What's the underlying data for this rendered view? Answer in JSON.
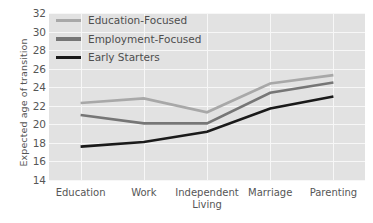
{
  "chart_data": {
    "type": "line",
    "title": "",
    "xlabel": "",
    "ylabel": "Expected age of transition",
    "categories": [
      "Education",
      "Work",
      "Independent\nLiving",
      "Marriage",
      "Parenting"
    ],
    "x_tick_labels": [
      "Education",
      "Work",
      "Independent Living",
      "Marriage",
      "Parenting"
    ],
    "ylim": [
      14,
      32
    ],
    "y_ticks": [
      14,
      16,
      18,
      20,
      22,
      24,
      26,
      28,
      30,
      32
    ],
    "grid": true,
    "legend_position": "upper left",
    "series": [
      {
        "name": "Education-Focused",
        "color": "#a8a8a8",
        "values": [
          22.3,
          22.8,
          21.3,
          24.4,
          25.3
        ]
      },
      {
        "name": "Employment-Focused",
        "color": "#767676",
        "values": [
          21.0,
          20.1,
          20.1,
          23.4,
          24.5
        ]
      },
      {
        "name": "Early Starters",
        "color": "#1a1a1a",
        "values": [
          17.6,
          18.1,
          19.2,
          21.7,
          23.0
        ]
      }
    ]
  },
  "style": {
    "plot_background": "#e2e2e2",
    "grid_color": "#f7f7f7",
    "figure_background": "#ffffff",
    "tick_color": "#565656"
  }
}
